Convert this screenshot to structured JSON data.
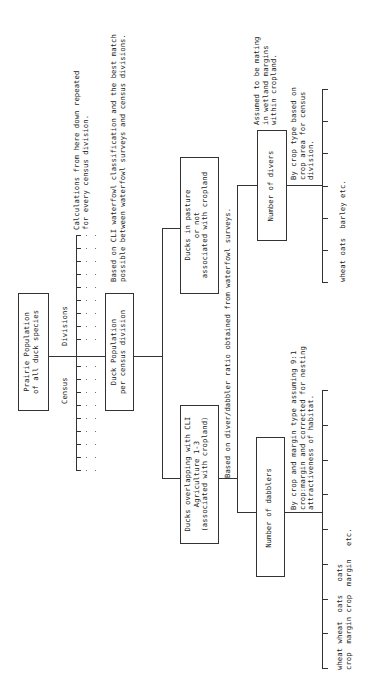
{
  "diagram": {
    "root": {
      "label": "Prairie Population\nof all duck species"
    },
    "census_axis": {
      "label_census": "Census",
      "label_divisions": "Divisions",
      "tick_count": 19
    },
    "repeat_note": "Calculations from here down repeated\nfor every census division.",
    "duck_pop": {
      "label": "Duck Population\nper census division"
    },
    "cli_note": "Based on CLI waterfowl classification and the best match\npossible between waterfowl surveys and census divisions.",
    "pasture": {
      "label": "Ducks in pasture\nor not\nassociated with cropland"
    },
    "overlap": {
      "label": "Ducks overlapping with CLI\nAgriculture 1-3\n(associated with cropland)"
    },
    "ratio_note": "Based on diver/dabbler ratio obtained from waterfowl surveys.",
    "divers": {
      "label": "Number of divers",
      "note_top": "Assumed to be mating\nin wetland margins\nwithin cropland.",
      "note_crop": "By crop type based on\ncrop area for census\ndivision.",
      "leaves": "wheat oats  barley etc.",
      "tick_count": 7
    },
    "dabblers": {
      "label": "Number of dabblers",
      "note": "By crop and margin type assuming 9:1\ncrop:margin and corrected for nesting\nattractiveness of habitat.",
      "leaves_line1": "wheat wheat  oats   oats",
      "leaves_line2": "crop  margin crop  margin   etc.",
      "tick_count": 9
    }
  }
}
